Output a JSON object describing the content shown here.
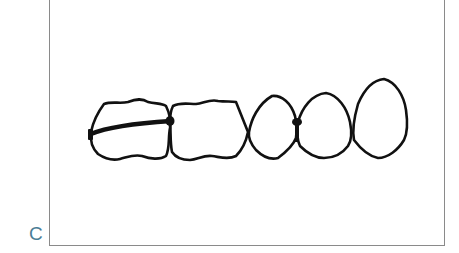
{
  "figure": {
    "panel_label": "C",
    "teeth": [
      {
        "id": "tooth-1",
        "type": "molar"
      },
      {
        "id": "tooth-2",
        "type": "molar"
      },
      {
        "id": "tooth-3",
        "type": "premolar"
      },
      {
        "id": "tooth-4",
        "type": "premolar"
      },
      {
        "id": "tooth-5",
        "type": "canine"
      }
    ],
    "colors": {
      "stroke": "#111111",
      "frame": "#8a8a8a",
      "label": "#4a7d96"
    }
  }
}
